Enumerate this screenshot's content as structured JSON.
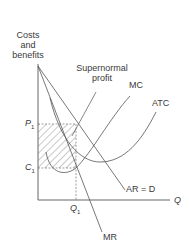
{
  "diagram": {
    "y_axis_label_line1": "Costs",
    "y_axis_label_line2": "and",
    "y_axis_label_line3": "benefits",
    "x_axis_label": "Q",
    "annotation": "Supernormal",
    "annotation_line2": "profit",
    "price_label": "P",
    "price_sub": "1",
    "cost_label": "C",
    "cost_sub": "1",
    "quantity_label": "Q",
    "quantity_sub": "1",
    "curves": {
      "mc": "MC",
      "atc": "ATC",
      "ar": "AR = D",
      "mr": "MR"
    },
    "colors": {
      "line": "#555555",
      "text": "#3a3a3a",
      "hatch": "#777777"
    }
  }
}
